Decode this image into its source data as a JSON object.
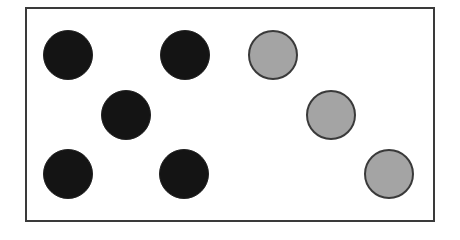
{
  "diagram": {
    "colors": {
      "black": "#141414",
      "gray": "#a4a4a4",
      "frame": "#3a3a3a"
    },
    "circles": [
      {
        "color": "black",
        "cx": 68,
        "cy": 55
      },
      {
        "color": "black",
        "cx": 185,
        "cy": 55
      },
      {
        "color": "black",
        "cx": 126,
        "cy": 115
      },
      {
        "color": "black",
        "cx": 68,
        "cy": 174
      },
      {
        "color": "black",
        "cx": 184,
        "cy": 174
      },
      {
        "color": "gray",
        "cx": 273,
        "cy": 55
      },
      {
        "color": "gray",
        "cx": 331,
        "cy": 115
      },
      {
        "color": "gray",
        "cx": 389,
        "cy": 174
      }
    ],
    "counts": {
      "black": 5,
      "gray": 3
    }
  }
}
